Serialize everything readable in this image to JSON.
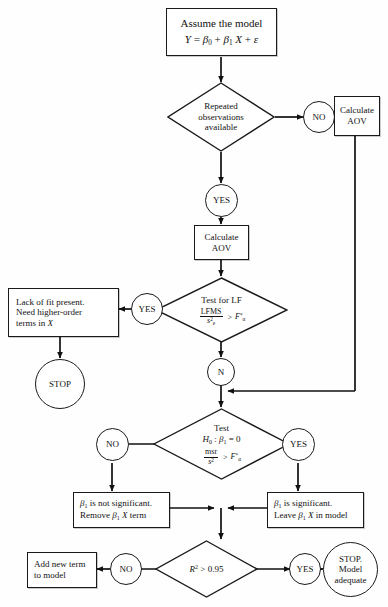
{
  "figure": {
    "type": "flowchart",
    "stroke_color": "#1a1a1a",
    "fill_color": "#ffffff"
  },
  "nodes": {
    "assume_model": {
      "shape": "box",
      "line1": "Assume the model",
      "line2_parts": {
        "y": "Y",
        "eq": " = ",
        "b0": "β",
        "b0sub": "0",
        "plus1": " + ",
        "b1": "β",
        "b1sub": "1",
        "x": " X",
        "plus2": " + ",
        "eps": "ε"
      }
    },
    "repeated_obs": {
      "shape": "diamond",
      "line1": "Repeated",
      "line2": "observations",
      "line3": "available"
    },
    "no_1": {
      "shape": "circle",
      "label": "NO"
    },
    "yes_1": {
      "shape": "circle",
      "label": "YES"
    },
    "calc_aov_right": {
      "shape": "box",
      "line1": "Calculate",
      "line2": "AOV"
    },
    "calc_aov_center": {
      "shape": "box",
      "line1": "Calculate",
      "line2": "AOV"
    },
    "test_lf": {
      "shape": "diamond",
      "line1": "Test for LF",
      "numerator": "LFMS",
      "denominator_base": "s",
      "denominator_sup": "2",
      "denominator_sub": "e",
      "operator": ">",
      "rhs_base": "F",
      "rhs_sup": "*",
      "rhs_sub": "α"
    },
    "yes_2": {
      "shape": "circle",
      "label": "YES"
    },
    "lack_of_fit": {
      "shape": "box",
      "line1": "Lack of fit present.",
      "line2": "Need higher-order",
      "line3_pre": "terms in ",
      "line3_math": "X"
    },
    "stop_1": {
      "shape": "circle",
      "label": "STOP"
    },
    "n_node": {
      "shape": "circle",
      "label": "N"
    },
    "test_slope": {
      "shape": "diamond",
      "line1": "Test",
      "line2_h": "H",
      "line2_hsub": "0",
      "line2_colon": " : ",
      "line2_beta": "β",
      "line2_betasub": "1",
      "line2_eq": " = 0",
      "numerator": "msr",
      "denominator_base": "s",
      "denominator_sup": "2",
      "operator": ">",
      "rhs_base": "F",
      "rhs_sup": "*",
      "rhs_sub": "α"
    },
    "no_2": {
      "shape": "circle",
      "label": "NO"
    },
    "yes_3": {
      "shape": "circle",
      "label": "YES"
    },
    "not_significant": {
      "shape": "box",
      "line1_beta": "β",
      "line1_sub": "1",
      "line1_rest": " is not significant.",
      "line2_pre": "Remove ",
      "line2_beta": "β",
      "line2_sub": "1",
      "line2_x": " X",
      "line2_post": " term"
    },
    "significant": {
      "shape": "box",
      "line1_beta": "β",
      "line1_sub": "1",
      "line1_rest": " is significant.",
      "line2_pre": "Leave ",
      "line2_beta": "β",
      "line2_sub": "1",
      "line2_x": " X",
      "line2_post": " in model"
    },
    "r2_test": {
      "shape": "diamond",
      "lhs_base": "R",
      "lhs_sup": "2",
      "operator": " > ",
      "value": "0.95"
    },
    "no_3": {
      "shape": "circle",
      "label": "NO"
    },
    "yes_4": {
      "shape": "circle",
      "label": "YES"
    },
    "add_new_term": {
      "shape": "box",
      "line1": "Add new term",
      "line2": "to model"
    },
    "stop_model_adequate": {
      "shape": "circle",
      "line1": "STOP.",
      "line2": "Model",
      "line3": "adequate"
    }
  }
}
